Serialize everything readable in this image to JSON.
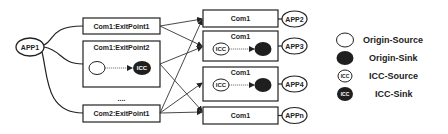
{
  "left_app": {
    "label": "APP1"
  },
  "exit_points": [
    {
      "label": "Com1:ExitPoint1",
      "has_flow": false
    },
    {
      "label": "Com1:ExitPoint2",
      "has_flow": true,
      "flow": {
        "source": "origin-source",
        "sink": "ICC-sink",
        "sink_label": "ICC"
      }
    },
    {
      "label": "Com2:ExitPoint1",
      "has_flow": false
    }
  ],
  "ellipsis": "....",
  "targets": [
    {
      "component": "Com1",
      "app": "APP2",
      "has_flow": false
    },
    {
      "component": "Com1",
      "app": "APP3",
      "has_flow": true,
      "flow": {
        "source": "ICC-source",
        "source_label": "ICC",
        "sink": "origin-sink"
      }
    },
    {
      "component": "Com1",
      "app": "APP4",
      "has_flow": true,
      "flow": {
        "source": "ICC-source",
        "source_label": "ICC",
        "sink": "origin-sink"
      }
    },
    {
      "component": "Com1",
      "app": "APPn",
      "has_flow": false
    }
  ],
  "connections": [
    {
      "from": "Com1:ExitPoint1",
      "to": "APP2"
    },
    {
      "from": "Com1:ExitPoint1",
      "to": "APP3"
    },
    {
      "from": "Com1:ExitPoint2",
      "to": "APP3"
    },
    {
      "from": "Com1:ExitPoint2",
      "to": "APPn"
    },
    {
      "from": "Com2:ExitPoint1",
      "to": "APP2"
    },
    {
      "from": "Com2:ExitPoint1",
      "to": "APP4"
    },
    {
      "from": "Com2:ExitPoint1",
      "to": "APPn"
    }
  ],
  "legend": {
    "items": [
      {
        "label": "Origin-Source",
        "style": "hollow",
        "glyph": ""
      },
      {
        "label": "Origin-Sink",
        "style": "filled",
        "glyph": ""
      },
      {
        "label": "ICC-Source",
        "style": "hollow",
        "glyph": "ICC"
      },
      {
        "label": "ICC-Sink",
        "style": "filled",
        "glyph": "ICC"
      }
    ]
  },
  "colors": {
    "stroke": "#222222",
    "fill_dark": "#1f1f1f",
    "background": "#ffffff"
  }
}
